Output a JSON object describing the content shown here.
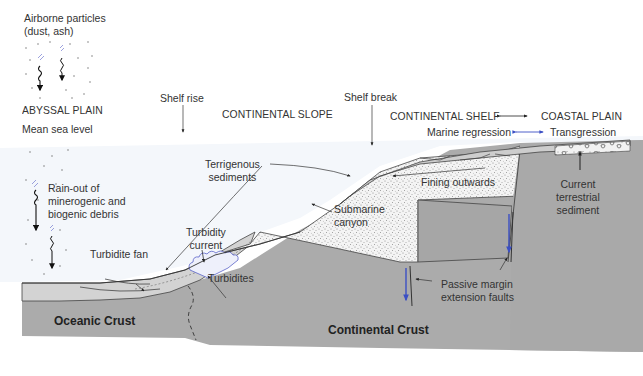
{
  "diagram": {
    "type": "geological cross-section",
    "colors": {
      "crust": "#aaaaaa",
      "crust_dark": "#a3a3a3",
      "sediment_light": "#d4d4d4",
      "shelf_sediment": "#c8c8c8",
      "stipple_fill": "#f3f3f3",
      "water_tint": "#f4f7fb",
      "fault_arrow_blue": "#3b4fc4",
      "turbidity_blue": "#5a63c8",
      "text": "#333333"
    },
    "regions": {
      "abyssal_plain": "ABYSSAL PLAIN",
      "continental_slope": "CONTINENTAL SLOPE",
      "continental_shelf": "CONTINENTAL SHELF",
      "coastal_plain": "COASTAL PLAIN"
    },
    "labels": {
      "airborne_line1": "Airborne particles",
      "airborne_line2": "(dust, ash)",
      "mean_sea_level": "Mean sea level",
      "rainout_line1": "Rain-out of",
      "rainout_line2": "minerogenic and",
      "rainout_line3": "biogenic debris",
      "shelf_rise": "Shelf rise",
      "shelf_break": "Shelf break",
      "marine_regression": "Marine regression",
      "transgression": "Transgression",
      "terrigenous_line1": "Terrigenous",
      "terrigenous_line2": "sediments",
      "turbidity_line1": "Turbidity",
      "turbidity_line2": "current",
      "turbidite_fan": "Turbidite fan",
      "turbidites": "Turbidites",
      "submarine_line1": "Submarine",
      "submarine_line2": "canyon",
      "fining_outwards": "Fining outwards",
      "current_terrestrial_line1": "Current",
      "current_terrestrial_line2": "terrestrial",
      "current_terrestrial_line3": "sediment",
      "passive_margin_line1": "Passive margin",
      "passive_margin_line2": "extension faults",
      "oceanic_crust": "Oceanic Crust",
      "continental_crust": "Continental Crust"
    }
  }
}
